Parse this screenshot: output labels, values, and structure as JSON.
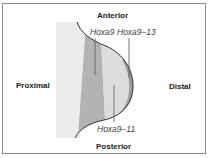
{
  "diagram": {
    "labels": {
      "anterior": "Anterior",
      "posterior": "Posterior",
      "proximal": "Proximal",
      "distal": "Distal"
    },
    "gene_domains": {
      "hoxa9": "Hoxa9",
      "hoxa9_13": "Hoxa9–13",
      "hoxa9_11": "Hoxa9–11"
    },
    "colors": {
      "outer_light": "#ececec",
      "hoxa9_band": "#b3b3b3",
      "hoxa9_11_band": "#dcdcdc",
      "hoxa9_13_band": "#9a9a9a",
      "outline": "#333333",
      "frame": "#8a8a8a"
    }
  }
}
